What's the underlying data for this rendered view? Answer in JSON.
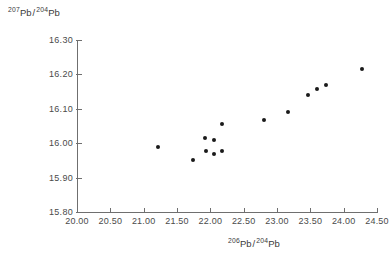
{
  "chart_data": {
    "type": "scatter",
    "title": "",
    "xlabel": "206Pb/204Pb",
    "ylabel": "207Pb/204Pb",
    "xlabel_parts": {
      "sup1": "206",
      "base1": "Pb",
      "slash": "/",
      "sup2": "204",
      "base2": "Pb"
    },
    "ylabel_parts": {
      "sup1": "207",
      "base1": "Pb",
      "slash": "/",
      "sup2": "204",
      "base2": "Pb"
    },
    "xlim": [
      20.0,
      24.5
    ],
    "ylim": [
      15.8,
      16.3
    ],
    "grid": false,
    "legend": "none",
    "marker": "filled-circle",
    "marker_color": "#1a1a1a",
    "axis_color": "#6f6f6f",
    "xticks": [
      20.0,
      20.5,
      21.0,
      21.5,
      22.0,
      22.5,
      23.0,
      23.5,
      24.0,
      24.5
    ],
    "xtick_labels": [
      "20.00",
      "20.50",
      "21.00",
      "21.50",
      "22.00",
      "22.50",
      "23.00",
      "23.50",
      "24.00",
      "24.50"
    ],
    "yticks": [
      15.8,
      15.9,
      16.0,
      16.1,
      16.2,
      16.3
    ],
    "ytick_labels": [
      "15.80",
      "15.90",
      "16.00",
      "16.10",
      "16.20",
      "16.30"
    ],
    "points": [
      {
        "x": 21.22,
        "y": 15.988
      },
      {
        "x": 21.74,
        "y": 15.951
      },
      {
        "x": 21.92,
        "y": 16.016
      },
      {
        "x": 21.93,
        "y": 15.978
      },
      {
        "x": 22.05,
        "y": 16.008
      },
      {
        "x": 22.06,
        "y": 15.97
      },
      {
        "x": 22.17,
        "y": 16.057
      },
      {
        "x": 22.18,
        "y": 15.978
      },
      {
        "x": 22.81,
        "y": 16.068
      },
      {
        "x": 23.17,
        "y": 16.09
      },
      {
        "x": 23.46,
        "y": 16.139
      },
      {
        "x": 23.6,
        "y": 16.159
      },
      {
        "x": 23.74,
        "y": 16.169
      },
      {
        "x": 24.28,
        "y": 16.216
      }
    ]
  }
}
